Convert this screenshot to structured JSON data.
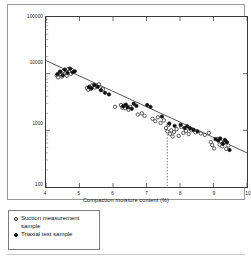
{
  "figure": {
    "y_axis_title": "Suction (kPa)",
    "x_axis_title": "Compaction moisture content (%)"
  },
  "legend": {
    "items": [
      {
        "marker": "open-circle",
        "label": "Suction measurement sample"
      },
      {
        "marker": "filled-circle",
        "label": "Triaxial test sample"
      }
    ]
  },
  "chart_data": {
    "type": "scatter",
    "title": "",
    "xlabel": "Compaction moisture content (%)",
    "ylabel": "Suction (kPa)",
    "xlim": [
      4,
      10
    ],
    "ylim": [
      100,
      100000
    ],
    "yscale": "log",
    "xscale": "linear",
    "grid": false,
    "legend_position": "below-plot",
    "xticks": [
      4,
      5,
      6,
      7,
      8,
      9,
      10
    ],
    "xtick_labels": [
      "4",
      "5",
      "6",
      "7",
      "8",
      "9",
      "10"
    ],
    "yticks": [
      100,
      1000,
      10000,
      100000
    ],
    "ytick_labels": [
      "100",
      "1000",
      "10000",
      "100000"
    ],
    "trendline": {
      "x": [
        4.0,
        10.0
      ],
      "y": [
        17000,
        400
      ],
      "style": "solid",
      "color": "#2a2a2a"
    },
    "annotations": [
      {
        "type": "vertical-dashed-line",
        "x": 7.62,
        "y_from": 100,
        "y_to": 960,
        "style": "dotted",
        "color": "#333333"
      }
    ],
    "series": [
      {
        "name": "Suction measurement sample",
        "marker": "open-circle",
        "color": "#1a1a1a",
        "points": [
          [
            4.32,
            9300
          ],
          [
            4.36,
            8600
          ],
          [
            4.4,
            10400
          ],
          [
            4.44,
            9600
          ],
          [
            4.48,
            8900
          ],
          [
            4.52,
            11200
          ],
          [
            4.58,
            10100
          ],
          [
            4.62,
            9200
          ],
          [
            4.66,
            12000
          ],
          [
            4.7,
            10700
          ],
          [
            4.74,
            9900
          ],
          [
            4.78,
            11500
          ],
          [
            5.22,
            5600
          ],
          [
            5.26,
            5200
          ],
          [
            5.3,
            5900
          ],
          [
            5.34,
            5400
          ],
          [
            5.38,
            6200
          ],
          [
            5.46,
            5700
          ],
          [
            5.52,
            6000
          ],
          [
            5.58,
            6500
          ],
          [
            5.62,
            5500
          ],
          [
            5.7,
            5300
          ],
          [
            6.06,
            2600
          ],
          [
            6.24,
            2800
          ],
          [
            6.28,
            2500
          ],
          [
            6.32,
            2700
          ],
          [
            6.36,
            2450
          ],
          [
            6.4,
            2750
          ],
          [
            6.46,
            2300
          ],
          [
            6.52,
            2600
          ],
          [
            6.74,
            1900
          ],
          [
            6.86,
            2000
          ],
          [
            6.94,
            1800
          ],
          [
            7.18,
            1600
          ],
          [
            7.26,
            1450
          ],
          [
            7.34,
            1700
          ],
          [
            7.42,
            1350
          ],
          [
            7.52,
            1500
          ],
          [
            7.58,
            1100
          ],
          [
            7.62,
            960
          ],
          [
            7.66,
            1250
          ],
          [
            7.7,
            870
          ],
          [
            7.74,
            1000
          ],
          [
            7.78,
            780
          ],
          [
            7.82,
            930
          ],
          [
            7.9,
            1050
          ],
          [
            7.96,
            800
          ],
          [
            8.04,
            1150
          ],
          [
            8.1,
            900
          ],
          [
            8.18,
            980
          ],
          [
            8.26,
            860
          ],
          [
            8.34,
            1000
          ],
          [
            8.46,
            920
          ],
          [
            8.62,
            880
          ],
          [
            8.74,
            830
          ],
          [
            8.86,
            900
          ],
          [
            8.92,
            620
          ],
          [
            8.96,
            550
          ],
          [
            9.02,
            480
          ],
          [
            9.12,
            700
          ],
          [
            9.18,
            560
          ],
          [
            9.22,
            640
          ],
          [
            9.26,
            520
          ],
          [
            9.32,
            600
          ],
          [
            9.38,
            470
          ],
          [
            9.44,
            540
          ]
        ]
      },
      {
        "name": "Triaxial test sample",
        "marker": "filled-circle",
        "color": "#111111",
        "points": [
          [
            4.34,
            9800
          ],
          [
            4.42,
            10900
          ],
          [
            4.5,
            9400
          ],
          [
            4.56,
            11800
          ],
          [
            4.64,
            10300
          ],
          [
            4.72,
            12300
          ],
          [
            4.8,
            10600
          ],
          [
            4.86,
            11000
          ],
          [
            5.28,
            5800
          ],
          [
            5.36,
            5500
          ],
          [
            5.44,
            6300
          ],
          [
            5.54,
            5900
          ],
          [
            5.64,
            5100
          ],
          [
            5.76,
            4600
          ],
          [
            5.88,
            4300
          ],
          [
            6.3,
            2650
          ],
          [
            6.38,
            2850
          ],
          [
            6.44,
            2550
          ],
          [
            6.56,
            2400
          ],
          [
            6.62,
            2950
          ],
          [
            6.7,
            2700
          ],
          [
            7.02,
            2800
          ],
          [
            7.12,
            2600
          ],
          [
            7.46,
            1750
          ],
          [
            7.68,
            1320
          ],
          [
            7.84,
            1200
          ],
          [
            8.02,
            1250
          ],
          [
            8.14,
            1100
          ],
          [
            8.22,
            1180
          ],
          [
            8.3,
            1080
          ],
          [
            8.4,
            1020
          ],
          [
            8.52,
            960
          ],
          [
            9.06,
            700
          ],
          [
            9.14,
            660
          ],
          [
            9.2,
            720
          ],
          [
            9.28,
            580
          ],
          [
            9.34,
            680
          ],
          [
            9.4,
            620
          ],
          [
            9.48,
            450
          ]
        ]
      }
    ]
  }
}
